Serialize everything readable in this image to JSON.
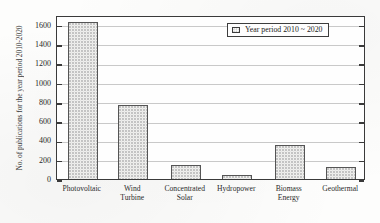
{
  "chart_data": {
    "type": "bar",
    "title": "",
    "subtitle": "",
    "xlabel": "",
    "ylabel": "No. of publications for the year period 2010-2020",
    "categories": [
      "Photovoltaic",
      "Wind\nTurbine",
      "Concentrated\nSolar",
      "Hydropower",
      "Biomass\nEnergy",
      "Geothermal"
    ],
    "values": [
      1630,
      765,
      150,
      45,
      355,
      120
    ],
    "ylim": [
      0,
      1700
    ],
    "yticks": [
      0,
      200,
      400,
      600,
      800,
      1000,
      1200,
      1400,
      1600
    ],
    "ytick_labels": [
      "0",
      "200",
      "400",
      "600",
      "800",
      "1000",
      "1200",
      "1400",
      "1600"
    ],
    "grid": true,
    "grid_axis": "y",
    "legend": {
      "position": "upper right",
      "entries": [
        {
          "label": "Year period 2010 ~ 2020",
          "swatch": "dotted-rectangle-swatch"
        }
      ]
    },
    "series": [
      {
        "name": "Year period 2010 ~ 2020",
        "values": [
          1630,
          765,
          150,
          45,
          355,
          120
        ]
      }
    ],
    "bar_fill": "#f7f7f5",
    "bar_edge": "#555555",
    "axis_color": "#3a3a3a",
    "grid_color": "#c9c9c9"
  }
}
